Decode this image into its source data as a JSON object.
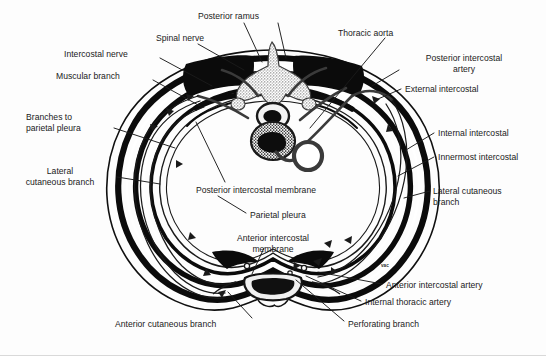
{
  "figure": {
    "colors": {
      "background": "#fdfdfd",
      "ink": "#0a0a0a",
      "label_text": "#1a1a1a",
      "leader_line": "#1a1a1a",
      "bone_fill": "#111111",
      "vertebra_stipple": "#6e6e6e",
      "border": "#d9d9d9"
    },
    "labels": [
      {
        "id": "posterior-ramus",
        "text": "Posterior ramus",
        "x": 198,
        "y": 11,
        "align": "left"
      },
      {
        "id": "spinal-nerve",
        "text": "Spinal nerve",
        "x": 156,
        "y": 33,
        "align": "left"
      },
      {
        "id": "thoracic-aorta",
        "text": "Thoracic aorta",
        "x": 338,
        "y": 28,
        "align": "left"
      },
      {
        "id": "intercostal-nerve",
        "text": "Intercostal nerve",
        "x": 64,
        "y": 49,
        "align": "left"
      },
      {
        "id": "posterior-intercostal-artery",
        "text": "Posterior intercostal\nartery",
        "x": 404,
        "y": 53,
        "align": "center"
      },
      {
        "id": "muscular-branch",
        "text": "Muscular branch",
        "x": 56,
        "y": 71,
        "align": "left"
      },
      {
        "id": "external-intercostal",
        "text": "External intercostal",
        "x": 405,
        "y": 84,
        "align": "left"
      },
      {
        "id": "branches-to-parietal-pleura",
        "text": "Branches to\nparietal pleura",
        "x": 26,
        "y": 112,
        "align": "left"
      },
      {
        "id": "internal-intercostal",
        "text": "Internal intercostal",
        "x": 438,
        "y": 128,
        "align": "left"
      },
      {
        "id": "innermost-intercostal",
        "text": "Innermost intercostal",
        "x": 438,
        "y": 152,
        "align": "left"
      },
      {
        "id": "posterior-intercostal-membrane",
        "text": "Posterior intercostal membrane",
        "x": 196,
        "y": 185,
        "align": "left"
      },
      {
        "id": "lateral-cutaneous-branch-left",
        "text": "Lateral\ncutaneous branch",
        "x": 10,
        "y": 166,
        "align": "center"
      },
      {
        "id": "lateral-cutaneous-branch-right",
        "text": "Lateral cutaneous\nbranch",
        "x": 433,
        "y": 186,
        "align": "left"
      },
      {
        "id": "parietal-pleura",
        "text": "Parietal pleura",
        "x": 250,
        "y": 210,
        "align": "left"
      },
      {
        "id": "anterior-intercostal-membrane",
        "text": "Anterior intercostal\nmembrane",
        "x": 228,
        "y": 233,
        "align": "center"
      },
      {
        "id": "vac-marker",
        "text": "vac",
        "x": 381,
        "y": 261,
        "align": "left"
      },
      {
        "id": "anterior-intercostal-artery",
        "text": "Anterior intercostal artery",
        "x": 386,
        "y": 283,
        "align": "left"
      },
      {
        "id": "internal-thoracic-artery",
        "text": "Internal thoracic artery",
        "x": 365,
        "y": 300,
        "align": "left"
      },
      {
        "id": "perforating-branch",
        "text": "Perforating branch",
        "x": 348,
        "y": 322,
        "align": "left"
      },
      {
        "id": "anterior-cutaneous-branch",
        "text": "Anterior cutaneous branch",
        "x": 115,
        "y": 322,
        "align": "left"
      }
    ],
    "structures": [
      {
        "id": "thorax-wall",
        "name": "Thoracic cage cross-section outline"
      },
      {
        "id": "vertebra",
        "name": "Thoracic vertebra with vertebral body and spinal canal"
      },
      {
        "id": "descending-aorta",
        "name": "Descending thoracic aorta (ring)"
      },
      {
        "id": "sternum",
        "name": "Sternum (anterior midline)"
      },
      {
        "id": "costal-cartilage",
        "name": "Costal cartilage"
      },
      {
        "id": "intercostal-muscle-bands",
        "name": "External, internal and innermost intercostal muscle layers"
      },
      {
        "id": "neurovascular-bundle",
        "name": "Intercostal neurovascular bundle"
      }
    ]
  }
}
